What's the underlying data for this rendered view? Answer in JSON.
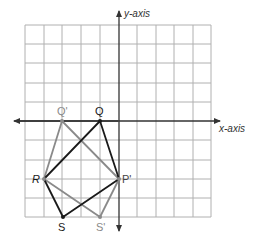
{
  "axes": {
    "x_label": "x-axis",
    "y_label": "y-axis"
  },
  "grid": {
    "columns": 10,
    "rows": 10,
    "origin_col": 5,
    "origin_row": 5,
    "line_color": "#a8a8a8",
    "axis_color": "#333333"
  },
  "figure": {
    "name": "QPSR",
    "color": "#1a1a1a",
    "vertices": [
      {
        "label": "Q",
        "x": -1,
        "y": 0
      },
      {
        "label": "P",
        "x": 0,
        "y": -3
      },
      {
        "label": "S",
        "x": -3,
        "y": -5
      },
      {
        "label": "R",
        "x": -4,
        "y": -3
      }
    ]
  },
  "image": {
    "name": "Q'P'S'R'",
    "color": "#8a8a8a",
    "vertices": [
      {
        "label": "Q'",
        "x": -3,
        "y": 0
      },
      {
        "label": "P'",
        "x": 0,
        "y": -3
      },
      {
        "label": "S'",
        "x": -1,
        "y": -5
      },
      {
        "label": "R'",
        "x": -4,
        "y": -3
      }
    ]
  },
  "labels": {
    "q": "Q",
    "q_prime": "Q'",
    "r": "R",
    "p_prime": "P'",
    "s": "S",
    "s_prime": "S'"
  }
}
